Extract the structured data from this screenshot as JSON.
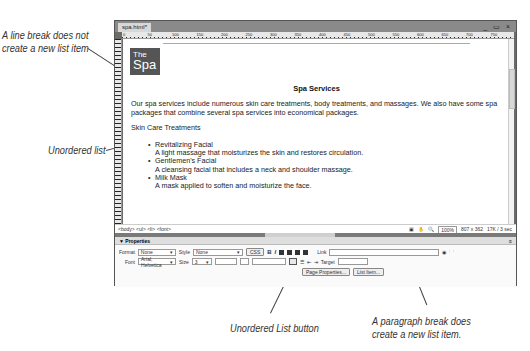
{
  "callouts": {
    "line_break": [
      "A line break does not",
      "create a new list item"
    ],
    "unordered_list": "Unordered list",
    "unordered_list_button": "Unordered List button",
    "paragraph_break": [
      "A paragraph break does",
      "create a new list item."
    ]
  },
  "window": {
    "tab": "spa.html*",
    "controls": "_ ▭ ×",
    "ruler_marks": [
      "0",
      "50",
      "100",
      "150",
      "200",
      "250",
      "300",
      "350",
      "400",
      "450",
      "500",
      "550",
      "600",
      "650",
      "700",
      "750"
    ]
  },
  "page": {
    "logo_small": "The",
    "logo_big": "Spa",
    "heading": "Spa Services",
    "intro": "Our spa services include numerous skin care treatments, body treatments, and massages. We also have some spa packages that combine several spa services into economical packages.",
    "section": "Skin Care Treatments",
    "items": [
      {
        "title": "Revitalizing Facial",
        "desc": "A light massage that moisturizes the skin and restores circulation."
      },
      {
        "title": "Gentlemen's Facial",
        "desc": "A cleansing facial that includes a neck and shoulder massage."
      },
      {
        "title": "Milk Mask",
        "desc": "A mask applied to soften and moisturize the face."
      }
    ]
  },
  "status": {
    "tags": "<body> <ul> <li> <font>",
    "zoom": "100%",
    "size": "807 x 362",
    "download": "17K / 3 sec"
  },
  "properties": {
    "title": "▼ Properties",
    "format_label": "Format",
    "format_value": "None",
    "style_label": "Style",
    "style_value": "None",
    "css_button": "CSS",
    "bold": "B",
    "italic": "I",
    "link_label": "Link",
    "font_label": "Font",
    "font_value": "Arial, Helvetica",
    "size_label": "Size",
    "size_value": "3",
    "target_label": "Target",
    "page_properties_button": "Page Properties...",
    "list_item_button": "List Item..."
  }
}
